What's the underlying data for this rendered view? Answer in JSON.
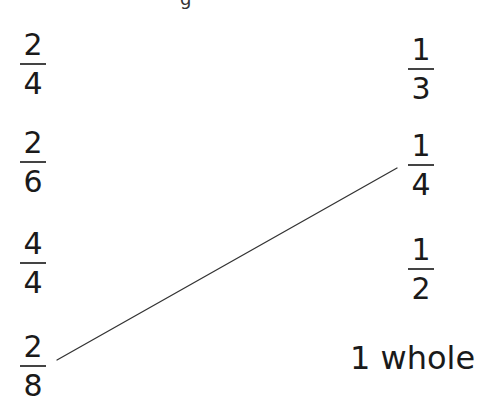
{
  "top_clipped_text": "g",
  "left_column": [
    {
      "numerator": "2",
      "denominator": "4"
    },
    {
      "numerator": "2",
      "denominator": "6"
    },
    {
      "numerator": "4",
      "denominator": "4"
    },
    {
      "numerator": "2",
      "denominator": "8"
    }
  ],
  "right_column": [
    {
      "numerator": "1",
      "denominator": "3"
    },
    {
      "numerator": "1",
      "denominator": "4"
    },
    {
      "numerator": "1",
      "denominator": "2"
    }
  ],
  "whole_label": "1 whole",
  "connections": [
    {
      "from": "2/8",
      "to": "1/4",
      "x1": 57,
      "y1": 360,
      "x2": 397,
      "y2": 168
    }
  ],
  "colors": {
    "text": "#1a1a1a",
    "line": "#333333",
    "background": "#ffffff"
  }
}
